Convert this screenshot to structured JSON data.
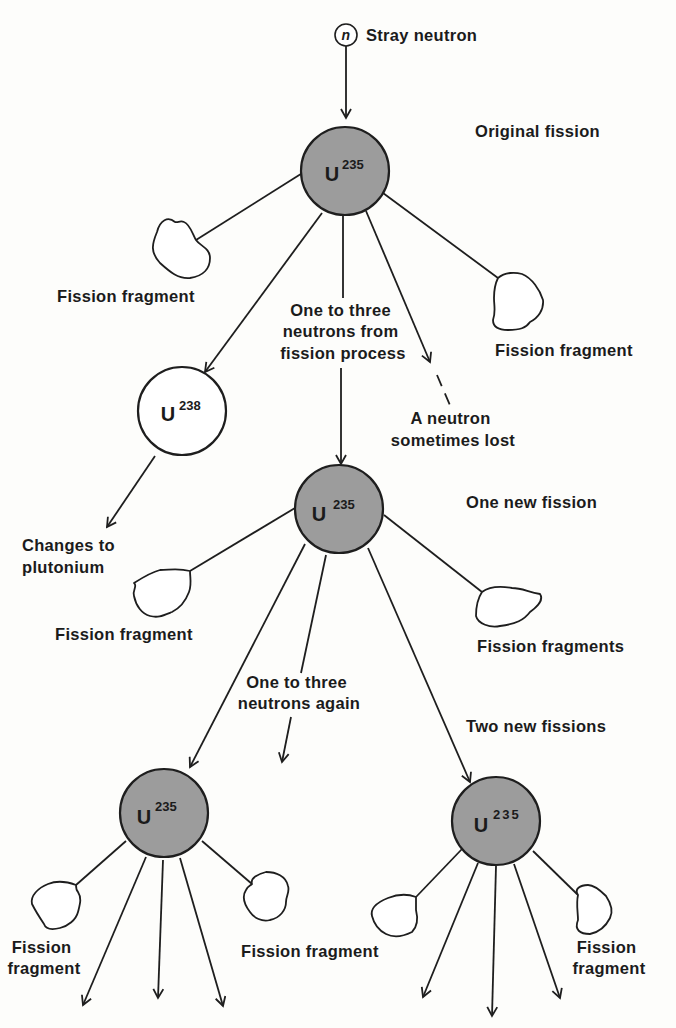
{
  "diagram": {
    "type": "nuclear-chain-reaction",
    "colors": {
      "u235_fill": "#9c9c9c",
      "u238_fill": "#ffffff",
      "line": "#1e1e1e",
      "background": "#fdfdfb"
    },
    "neutron": {
      "symbol": "n",
      "label": "Stray neutron"
    },
    "stage_labels": {
      "original": "Original fission",
      "one_new": "One new fission",
      "two_new": "Two new fissions"
    },
    "nuclei": {
      "u235_original": {
        "element": "U",
        "mass": "235"
      },
      "u238": {
        "element": "U",
        "mass": "238"
      },
      "u235_second": {
        "element": "U",
        "mass": "235"
      },
      "u235_third_left": {
        "element": "U",
        "mass": "235"
      },
      "u235_third_right": {
        "element": "U",
        "mass": "235"
      }
    },
    "annotations": {
      "neutrons_from_fission": [
        "One to three",
        "neutrons from",
        "fission process"
      ],
      "neutron_lost": [
        "A neutron",
        "sometimes lost"
      ],
      "plutonium": [
        "Changes to",
        "plutonium"
      ],
      "neutrons_again": [
        "One to three",
        "neutrons again"
      ]
    },
    "fragments": {
      "f1_left": [
        "Fission fragment"
      ],
      "f1_right": [
        "Fission fragment"
      ],
      "f2_left": [
        "Fission fragment"
      ],
      "f2_right": [
        "Fission fragments"
      ],
      "f3_left_left": [
        "Fission",
        "fragment"
      ],
      "f3_mid": [
        "Fission fragment"
      ],
      "f3_right_right": [
        "Fission",
        "fragment"
      ]
    }
  }
}
